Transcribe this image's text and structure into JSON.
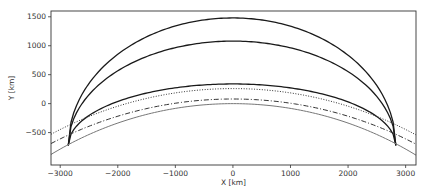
{
  "chart_data": {
    "type": "line",
    "title": "",
    "xlabel": "X [km]",
    "ylabel": "Y [km]",
    "xlim": [
      -3160,
      3180
    ],
    "ylim": [
      -1060,
      1600
    ],
    "grid": false,
    "legend": null,
    "xticks": [
      -3000,
      -2000,
      -1000,
      0,
      1000,
      2000,
      3000
    ],
    "yticks": [
      -500,
      0,
      500,
      1000,
      1500
    ],
    "xtick_labels": [
      "−3000",
      "−2000",
      "−1000",
      "0",
      "1000",
      "2000",
      "3000"
    ],
    "ytick_labels": [
      "−500",
      "0",
      "500",
      "1000",
      "1500"
    ],
    "series": [
      {
        "name": "trajectory-high",
        "style": "solid",
        "color": "#1a1a1a",
        "width": 1.3,
        "kind": "arc",
        "x_start": -2860,
        "x_end": 2830,
        "y_end": -720,
        "peak": 1480
      },
      {
        "name": "trajectory-mid",
        "style": "solid",
        "color": "#1a1a1a",
        "width": 1.3,
        "kind": "arc",
        "x_start": -2860,
        "x_end": 2830,
        "y_end": -720,
        "peak": 1080
      },
      {
        "name": "trajectory-low",
        "style": "solid",
        "color": "#1a1a1a",
        "width": 1.3,
        "kind": "arc",
        "x_start": -2860,
        "x_end": 2830,
        "y_end": -720,
        "peak": 340
      },
      {
        "name": "atmosphere-top",
        "style": "dotted",
        "color": "#333333",
        "width": 1.0,
        "kind": "surface",
        "peak": 260,
        "edge": -540
      },
      {
        "name": "reference-surface",
        "style": "dashdot",
        "color": "#333333",
        "width": 1.0,
        "kind": "surface",
        "peak": 80,
        "edge": -700
      },
      {
        "name": "ground",
        "style": "solid",
        "color": "#777777",
        "width": 1.0,
        "kind": "surface",
        "peak": 0,
        "edge": -890
      }
    ]
  }
}
